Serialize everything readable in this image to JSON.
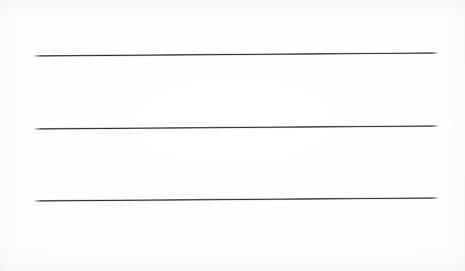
{
  "document": {
    "kind": "scanned-ruled-lines",
    "description": "Blank scanned sheet showing three long horizontal ruled lines",
    "background_color": "#fefefe",
    "width": 465,
    "height": 271
  },
  "rules": [
    {
      "name": "rule-1",
      "label": "Top horizontal line",
      "x": 34,
      "y": 55,
      "length": 404,
      "thickness": 1.7,
      "tilt_deg": -0.42,
      "color": "#303030"
    },
    {
      "name": "rule-2",
      "label": "Middle horizontal line",
      "x": 34,
      "y": 128,
      "length": 404,
      "thickness": 1.7,
      "tilt_deg": -0.42,
      "color": "#303030"
    },
    {
      "name": "rule-3",
      "label": "Bottom horizontal line",
      "x": 34,
      "y": 200,
      "length": 404,
      "thickness": 1.7,
      "tilt_deg": -0.42,
      "color": "#303030"
    }
  ]
}
